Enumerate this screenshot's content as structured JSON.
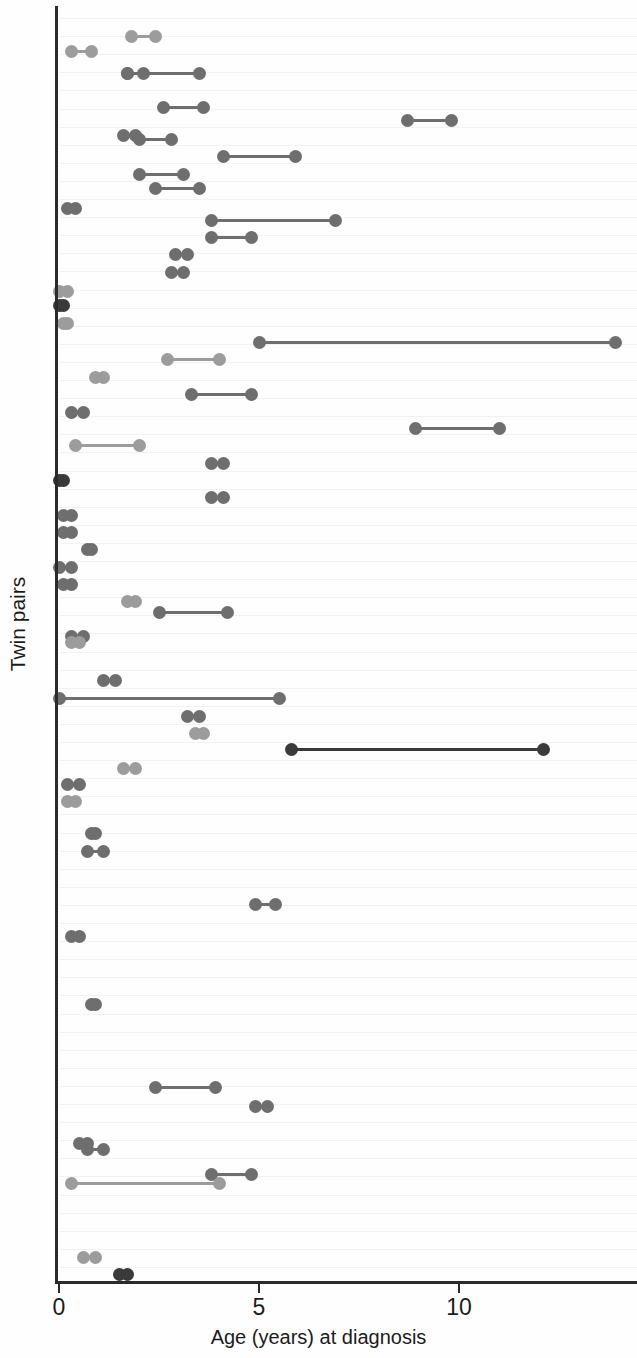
{
  "axes": {
    "xlabel": "Age (years) at diagnosis",
    "ylabel": "Twin pairs",
    "xticks": [
      "0",
      "5",
      "10"
    ]
  },
  "palette": {
    "light": "#9c9c9c",
    "medium": "#6e6e6e",
    "dark": "#3a3a3a",
    "grid": "#f2f2f2",
    "axis": "#2b2b2b"
  },
  "chart_data": {
    "type": "scatter",
    "title": "",
    "xlabel": "Age (years) at diagnosis",
    "ylabel": "Twin pairs",
    "xlim": [
      0,
      14.5
    ],
    "xticks": [
      0,
      5,
      10
    ],
    "grid": true,
    "legend": "none",
    "rows": [
      {
        "i": 1,
        "a": 1.8,
        "b": 2.4,
        "shade": "light"
      },
      {
        "i": 2,
        "a": 0.3,
        "b": 0.8,
        "shade": "light"
      },
      {
        "i": 3,
        "a": 1.7,
        "b": 2.1,
        "shade": "medium"
      },
      {
        "i": 4,
        "a": 1.7,
        "b": 3.5,
        "shade": "medium"
      },
      {
        "i": 5,
        "a": 1.6,
        "b": 1.9,
        "shade": "medium"
      },
      {
        "i": 6,
        "a": 2.6,
        "b": 3.6,
        "shade": "medium"
      },
      {
        "i": 7,
        "a": 8.7,
        "b": 9.8,
        "shade": "medium"
      },
      {
        "i": 8,
        "a": 2.0,
        "b": 2.8,
        "shade": "medium"
      },
      {
        "i": 9,
        "a": 4.1,
        "b": 5.9,
        "shade": "medium"
      },
      {
        "i": 10,
        "a": 2.0,
        "b": 3.1,
        "shade": "medium"
      },
      {
        "i": 11,
        "a": 2.4,
        "b": 3.5,
        "shade": "medium"
      },
      {
        "i": 12,
        "a": 0.2,
        "b": 0.4,
        "shade": "medium"
      },
      {
        "i": 13,
        "a": 3.8,
        "b": 6.9,
        "shade": "medium"
      },
      {
        "i": 14,
        "a": 3.8,
        "b": 4.8,
        "shade": "medium"
      },
      {
        "i": 15,
        "a": 2.9,
        "b": 3.2,
        "shade": "medium"
      },
      {
        "i": 16,
        "a": 2.8,
        "b": 3.1,
        "shade": "medium"
      },
      {
        "i": 17,
        "a": 0.0,
        "b": 0.2,
        "shade": "light"
      },
      {
        "i": 18,
        "a": 0.0,
        "b": 0.1,
        "shade": "dark"
      },
      {
        "i": 19,
        "a": 0.1,
        "b": 0.2,
        "shade": "light"
      },
      {
        "i": 20,
        "a": 5.0,
        "b": 13.9,
        "shade": "medium"
      },
      {
        "i": 21,
        "a": 2.7,
        "b": 4.0,
        "shade": "light"
      },
      {
        "i": 22,
        "a": 0.9,
        "b": 1.1,
        "shade": "light"
      },
      {
        "i": 23,
        "a": 3.3,
        "b": 4.8,
        "shade": "medium"
      },
      {
        "i": 24,
        "a": 0.3,
        "b": 0.6,
        "shade": "medium"
      },
      {
        "i": 25,
        "a": 8.9,
        "b": 11.0,
        "shade": "medium"
      },
      {
        "i": 26,
        "a": 0.4,
        "b": 2.0,
        "shade": "light"
      },
      {
        "i": 27,
        "a": 3.8,
        "b": 4.1,
        "shade": "medium"
      },
      {
        "i": 28,
        "a": 0.0,
        "b": 0.1,
        "shade": "dark"
      },
      {
        "i": 29,
        "a": 3.8,
        "b": 4.1,
        "shade": "medium"
      },
      {
        "i": 30,
        "a": 0.1,
        "b": 0.3,
        "shade": "medium"
      },
      {
        "i": 31,
        "a": 0.1,
        "b": 0.3,
        "shade": "medium"
      },
      {
        "i": 32,
        "a": 0.7,
        "b": 0.8,
        "shade": "medium"
      },
      {
        "i": 33,
        "a": 0.0,
        "b": 0.3,
        "shade": "medium"
      },
      {
        "i": 34,
        "a": 0.1,
        "b": 0.3,
        "shade": "medium"
      },
      {
        "i": 35,
        "a": 1.7,
        "b": 1.9,
        "shade": "light"
      },
      {
        "i": 36,
        "a": 2.5,
        "b": 4.2,
        "shade": "medium"
      },
      {
        "i": 37,
        "a": 0.3,
        "b": 0.6,
        "shade": "medium"
      },
      {
        "i": 38,
        "a": 0.3,
        "b": 0.5,
        "shade": "light"
      },
      {
        "i": 39,
        "a": 1.1,
        "b": 1.4,
        "shade": "medium"
      },
      {
        "i": 40,
        "a": 0.0,
        "b": 5.5,
        "shade": "medium"
      },
      {
        "i": 41,
        "a": 3.2,
        "b": 3.5,
        "shade": "medium"
      },
      {
        "i": 42,
        "a": 3.4,
        "b": 3.6,
        "shade": "light"
      },
      {
        "i": 43,
        "a": 5.8,
        "b": 12.1,
        "shade": "dark"
      },
      {
        "i": 44,
        "a": 1.6,
        "b": 1.9,
        "shade": "light"
      },
      {
        "i": 45,
        "a": 0.2,
        "b": 0.5,
        "shade": "medium"
      },
      {
        "i": 46,
        "a": 0.2,
        "b": 0.4,
        "shade": "light"
      },
      {
        "i": 47,
        "a": 0.8,
        "b": 0.9,
        "shade": "medium"
      },
      {
        "i": 48,
        "a": 0.7,
        "b": 1.1,
        "shade": "medium"
      },
      {
        "i": 49,
        "a": 4.9,
        "b": 5.4,
        "shade": "medium"
      },
      {
        "i": 50,
        "a": 0.3,
        "b": 0.5,
        "shade": "medium"
      },
      {
        "i": 51,
        "a": 0.8,
        "b": 0.9,
        "shade": "medium"
      },
      {
        "i": 52,
        "a": 2.4,
        "b": 3.9,
        "shade": "medium"
      },
      {
        "i": 53,
        "a": 4.9,
        "b": 5.2,
        "shade": "medium"
      },
      {
        "i": 54,
        "a": 0.5,
        "b": 0.7,
        "shade": "medium"
      },
      {
        "i": 55,
        "a": 0.7,
        "b": 1.1,
        "shade": "medium"
      },
      {
        "i": 56,
        "a": 3.8,
        "b": 4.8,
        "shade": "medium"
      },
      {
        "i": 57,
        "a": 0.3,
        "b": 4.0,
        "shade": "light"
      },
      {
        "i": 58,
        "a": 0.6,
        "b": 0.9,
        "shade": "light"
      },
      {
        "i": 59,
        "a": 1.5,
        "b": 1.7,
        "shade": "dark"
      }
    ],
    "row_y": [
      28,
      43,
      65,
      65,
      127,
      99,
      112,
      131,
      148,
      166,
      180,
      200,
      212,
      229,
      246,
      264,
      283,
      297,
      315,
      334,
      351,
      369,
      386,
      404,
      420,
      437,
      455,
      472,
      489,
      507,
      524,
      541,
      559,
      576,
      593,
      604,
      628,
      634,
      672,
      690,
      708,
      725,
      741,
      760,
      776,
      793,
      825,
      843,
      896,
      928,
      996,
      1079,
      1098,
      1135,
      1141,
      1166,
      1175,
      1249,
      1266
    ]
  }
}
